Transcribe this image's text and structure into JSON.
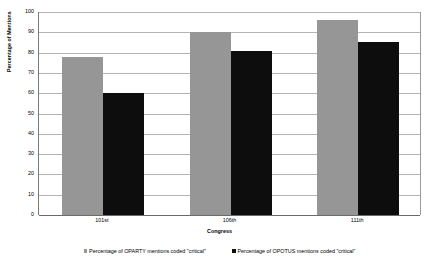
{
  "chart_data": {
    "type": "bar",
    "title": "",
    "xlabel": "Congress",
    "ylabel": "Percentage of Mentions",
    "categories": [
      "101st",
      "106th",
      "111th"
    ],
    "series": [
      {
        "name": "Percentage of OPARTY mentions coded \"critical\"",
        "color": "#969696",
        "values": [
          78,
          90,
          96
        ]
      },
      {
        "name": "Percentage of OPOTUS mentions coded \"critical\"",
        "color": "#0d0d0d",
        "values": [
          60,
          81,
          85
        ]
      }
    ],
    "ylim": [
      0,
      100
    ],
    "yticks": [
      0,
      10,
      20,
      30,
      40,
      50,
      60,
      70,
      80,
      90,
      100
    ],
    "ytick_labels": [
      "0",
      "10",
      "20",
      "30",
      "40",
      "50",
      "60",
      "70",
      "80",
      "90",
      "100"
    ],
    "grid": true,
    "legend_position": "bottom",
    "background_color": "#ffffff",
    "gridline_color": "#b4b4b4",
    "axis_color": "#6b6b6b"
  }
}
